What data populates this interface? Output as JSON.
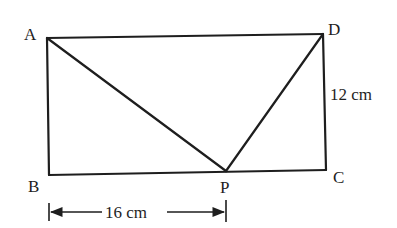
{
  "diagram": {
    "type": "geometry-rectangle",
    "points": {
      "A": {
        "label": "A",
        "x": 47,
        "y": 38
      },
      "B": {
        "label": "B",
        "x": 49,
        "y": 175
      },
      "C": {
        "label": "C",
        "x": 326,
        "y": 170
      },
      "D": {
        "label": "D",
        "x": 323,
        "y": 34
      },
      "P": {
        "label": "P",
        "x": 226,
        "y": 171
      }
    },
    "segments": [
      "AD",
      "DC",
      "CB",
      "BA",
      "AP",
      "DP"
    ],
    "measurements": {
      "DC": "12 cm",
      "BP": "16 cm"
    },
    "color": "#1e1e1e"
  }
}
